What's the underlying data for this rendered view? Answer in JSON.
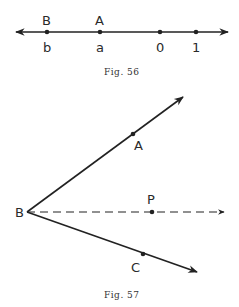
{
  "figures": [
    {
      "caption": "Fig. 56",
      "type": "number-line",
      "points_above": [
        "B",
        "A"
      ],
      "labels_below": [
        "b",
        "a",
        "0",
        "1"
      ]
    },
    {
      "caption": "Fig. 57",
      "type": "angle-with-bisector",
      "vertex": "B",
      "points": [
        "A",
        "P",
        "C"
      ]
    }
  ],
  "fig56": {
    "caption": "Fig. 56",
    "B": "B",
    "A": "A",
    "b": "b",
    "a": "a",
    "zero": "0",
    "one": "1"
  },
  "fig57": {
    "caption": "Fig. 57",
    "A": "A",
    "B": "B",
    "P": "P",
    "C": "C"
  }
}
